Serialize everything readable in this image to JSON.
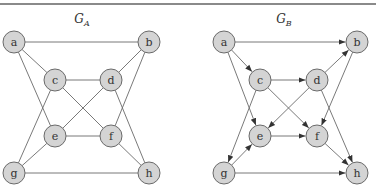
{
  "graphs": [
    {
      "id": "GA",
      "title": "G",
      "subscript": "A",
      "title_x": 82,
      "directed": false,
      "nodes": [
        {
          "id": "a",
          "label": "a",
          "x": 14,
          "y": 42
        },
        {
          "id": "b",
          "label": "b",
          "x": 149,
          "y": 42
        },
        {
          "id": "c",
          "label": "c",
          "x": 55,
          "y": 80
        },
        {
          "id": "d",
          "label": "d",
          "x": 111,
          "y": 80
        },
        {
          "id": "e",
          "label": "e",
          "x": 55,
          "y": 136
        },
        {
          "id": "f",
          "label": "f",
          "x": 111,
          "y": 136
        },
        {
          "id": "g",
          "label": "g",
          "x": 14,
          "y": 173
        },
        {
          "id": "h",
          "label": "h",
          "x": 149,
          "y": 173
        }
      ],
      "edges": [
        [
          "a",
          "b"
        ],
        [
          "a",
          "c"
        ],
        [
          "a",
          "e"
        ],
        [
          "b",
          "d"
        ],
        [
          "b",
          "f"
        ],
        [
          "c",
          "d"
        ],
        [
          "c",
          "f"
        ],
        [
          "c",
          "g"
        ],
        [
          "d",
          "e"
        ],
        [
          "d",
          "h"
        ],
        [
          "e",
          "f"
        ],
        [
          "e",
          "g"
        ],
        [
          "f",
          "h"
        ],
        [
          "g",
          "h"
        ]
      ]
    },
    {
      "id": "GB",
      "title": "G",
      "subscript": "B",
      "title_x": 284,
      "directed": true,
      "nodes": [
        {
          "id": "a",
          "label": "a",
          "x": 224,
          "y": 42
        },
        {
          "id": "b",
          "label": "b",
          "x": 357,
          "y": 42
        },
        {
          "id": "c",
          "label": "c",
          "x": 260,
          "y": 80
        },
        {
          "id": "d",
          "label": "d",
          "x": 317,
          "y": 80
        },
        {
          "id": "e",
          "label": "e",
          "x": 260,
          "y": 136
        },
        {
          "id": "f",
          "label": "f",
          "x": 317,
          "y": 136
        },
        {
          "id": "g",
          "label": "g",
          "x": 224,
          "y": 173
        },
        {
          "id": "h",
          "label": "h",
          "x": 357,
          "y": 173
        }
      ],
      "edges": [
        [
          "a",
          "b"
        ],
        [
          "a",
          "c"
        ],
        [
          "a",
          "e"
        ],
        [
          "d",
          "b"
        ],
        [
          "b",
          "f"
        ],
        [
          "c",
          "d"
        ],
        [
          "c",
          "f"
        ],
        [
          "c",
          "g"
        ],
        [
          "d",
          "e"
        ],
        [
          "d",
          "h"
        ],
        [
          "e",
          "f"
        ],
        [
          "g",
          "e"
        ],
        [
          "f",
          "h"
        ],
        [
          "g",
          "h"
        ]
      ]
    }
  ],
  "style": {
    "node_fill": "#d4d4d4",
    "node_stroke": "#6a6a6a",
    "edge_color": "#6a6a6a",
    "node_radius": 11
  }
}
